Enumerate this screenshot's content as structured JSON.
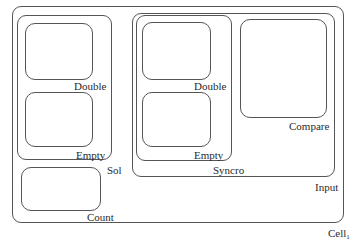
{
  "diagram": {
    "type": "nested-containers",
    "line_color": "#555555",
    "text_color": "#2a2a2a",
    "containers": {
      "cell": {
        "label": "Cell",
        "subscript": "1"
      },
      "input": {
        "label": "Input"
      },
      "sol": {
        "label": "Sol"
      },
      "sol_double": {
        "label": "Double"
      },
      "sol_empty": {
        "label": "Empty"
      },
      "count": {
        "label": "Count"
      },
      "syncro": {
        "label": "Syncro"
      },
      "syncro_double": {
        "label": "Double"
      },
      "syncro_empty": {
        "label": "Empty"
      },
      "compare": {
        "label": "Compare"
      }
    }
  }
}
